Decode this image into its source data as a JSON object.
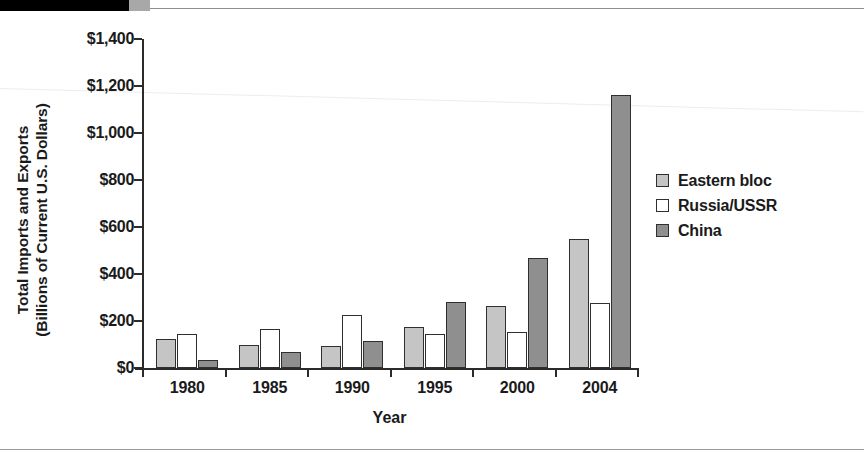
{
  "chart_data": {
    "type": "bar",
    "title": "",
    "subtitle": "",
    "xlabel": "Year",
    "ylabel": "Total Imports and Exports (Billions of Current U.S. Dollars)",
    "ylabel_lines": [
      "Total Imports and Exports",
      "(Billions of Current U.S. Dollars)"
    ],
    "categories": [
      "1980",
      "1985",
      "1990",
      "1995",
      "2000",
      "2004"
    ],
    "series": [
      {
        "name": "Eastern bloc",
        "color": "#c5c5c5",
        "values": [
          125,
          100,
          92,
          175,
          265,
          550
        ]
      },
      {
        "name": "Russia/USSR",
        "color": "#ffffff",
        "values": [
          143,
          165,
          225,
          145,
          152,
          278
        ]
      },
      {
        "name": "China",
        "color": "#8f8f8f",
        "values": [
          35,
          70,
          115,
          280,
          470,
          1160
        ]
      }
    ],
    "ylim": [
      0,
      1400
    ],
    "ytick_values": [
      0,
      200,
      400,
      600,
      800,
      1000,
      1200,
      1400
    ],
    "ytick_labels": [
      "$0",
      "$200",
      "$400",
      "$600",
      "$800",
      "$1,000",
      "$1,200",
      "$1,400"
    ],
    "grid": false,
    "legend_position": "right"
  },
  "legend": {
    "items": [
      {
        "label": "Eastern bloc",
        "swatch": "light-gray"
      },
      {
        "label": "Russia/USSR",
        "swatch": "white"
      },
      {
        "label": "China",
        "swatch": "dark-gray"
      }
    ]
  },
  "colors": {
    "eastern_bloc": "#c5c5c5",
    "russia_ussr": "#ffffff",
    "china": "#8f8f8f",
    "axis": "#2b2b2b",
    "text": "#1a1a1a"
  }
}
